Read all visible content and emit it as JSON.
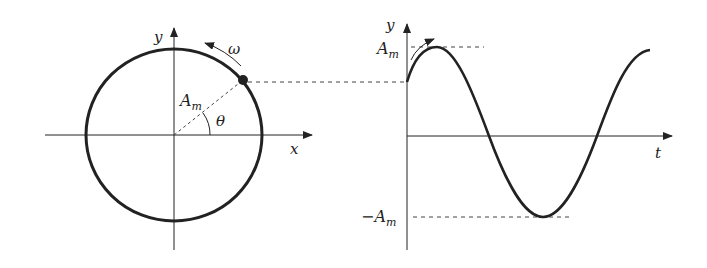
{
  "figure": {
    "left": {
      "x_axis_label": "x",
      "y_axis_label": "y",
      "radius_label": "A",
      "radius_sub": "m",
      "angle_label": "θ",
      "angular_velocity_label": "ω"
    },
    "right": {
      "x_axis_label": "t",
      "y_axis_label": "y",
      "max_label": "A",
      "max_sub": "m",
      "min_label": "−A",
      "min_sub": "m"
    },
    "colors": {
      "stroke": "#222222",
      "dash": "#444444",
      "background": "#ffffff"
    }
  }
}
